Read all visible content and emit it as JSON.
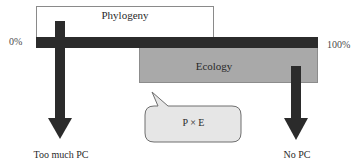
{
  "diagram": {
    "axis": {
      "start_label": "0%",
      "end_label": "100%"
    },
    "boxes": {
      "phylogeny": {
        "label": "Phylogeny",
        "fill": "#ffffff",
        "border": "#8a8a8a"
      },
      "ecology": {
        "label": "Ecology",
        "fill": "#a9a9a9",
        "border": "#8c8c8c"
      },
      "bar": {
        "fill": "#2b2b2b"
      }
    },
    "arrows": [
      {
        "id": "left",
        "label": "Too much PC",
        "color": "#2b2b2b"
      },
      {
        "id": "right",
        "label": "No PC",
        "color": "#2b2b2b"
      }
    ],
    "callout": {
      "label": "P × E",
      "fill": "#e6e6e6",
      "border": "#6e6e6e"
    }
  }
}
